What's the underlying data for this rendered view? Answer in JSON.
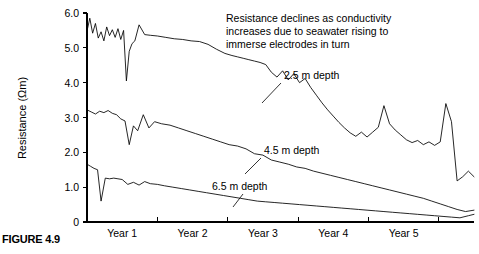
{
  "figure": {
    "caption": "FIGURE 4.9"
  },
  "chart_data": {
    "type": "line",
    "title": "",
    "xlabel": "",
    "ylabel": "Resistance (Ωm)",
    "ylim": [
      0,
      6.0
    ],
    "xlim": [
      0,
      5.5
    ],
    "grid": false,
    "legend_position": "inline-annotations",
    "y_ticks": [
      "0",
      "1.0",
      "2.0",
      "3.0",
      "4.0",
      "5.0",
      "6.0"
    ],
    "y_tick_values": [
      0,
      1.0,
      2.0,
      3.0,
      4.0,
      5.0,
      6.0
    ],
    "x_ticks": [
      "Year 1",
      "Year 2",
      "Year 3",
      "Year 4",
      "Year 5"
    ],
    "x_tick_centers": [
      0.5,
      1.5,
      2.5,
      3.5,
      4.5
    ],
    "x_tick_boundaries": [
      1,
      2,
      3,
      4,
      5
    ],
    "annotation": {
      "line1": "Resistance declines as conductivity",
      "line2": "increases due to seawater rising to",
      "line3": "immerse electrodes in turn"
    },
    "series": [
      {
        "name": "2.5 m depth",
        "label": "2.5 m depth",
        "x": [
          0.0,
          0.04,
          0.08,
          0.12,
          0.16,
          0.2,
          0.24,
          0.28,
          0.32,
          0.36,
          0.4,
          0.44,
          0.48,
          0.52,
          0.56,
          0.6,
          0.64,
          0.68,
          0.74,
          0.82,
          0.9,
          1.0,
          1.12,
          1.24,
          1.36,
          1.48,
          1.6,
          1.72,
          1.84,
          1.96,
          2.06,
          2.14,
          2.22,
          2.3,
          2.38,
          2.46,
          2.54,
          2.62,
          2.7,
          2.78,
          2.86,
          2.94,
          3.02,
          3.1,
          3.18,
          3.26,
          3.34,
          3.42,
          3.5,
          3.58,
          3.66,
          3.74,
          3.82,
          3.9,
          3.98,
          4.06,
          4.14,
          4.22,
          4.3,
          4.38,
          4.46,
          4.54,
          4.62,
          4.7,
          4.78,
          4.86,
          4.94,
          5.02,
          5.1,
          5.18,
          5.26,
          5.34,
          5.42,
          5.5
        ],
        "y": [
          5.48,
          5.85,
          5.42,
          5.7,
          5.28,
          5.46,
          5.2,
          5.6,
          5.35,
          5.52,
          5.3,
          5.55,
          5.24,
          5.5,
          4.05,
          4.9,
          5.12,
          5.2,
          5.66,
          5.38,
          5.36,
          5.34,
          5.3,
          5.26,
          5.24,
          5.2,
          5.18,
          5.1,
          4.96,
          4.84,
          4.78,
          4.74,
          4.7,
          4.66,
          4.62,
          4.58,
          4.52,
          4.3,
          4.16,
          4.34,
          4.08,
          4.26,
          4.0,
          4.12,
          3.86,
          3.64,
          3.42,
          3.22,
          3.04,
          2.86,
          2.7,
          2.56,
          2.46,
          2.58,
          2.44,
          2.58,
          2.72,
          3.34,
          2.82,
          2.64,
          2.5,
          2.36,
          2.28,
          2.34,
          2.22,
          2.3,
          2.2,
          2.3,
          3.4,
          2.88,
          1.18,
          1.3,
          1.46,
          1.3
        ]
      },
      {
        "name": "4.5 m depth",
        "label": "4.5 m depth",
        "x": [
          0.0,
          0.06,
          0.12,
          0.18,
          0.24,
          0.3,
          0.36,
          0.42,
          0.48,
          0.54,
          0.6,
          0.66,
          0.72,
          0.8,
          0.88,
          0.96,
          1.06,
          1.18,
          1.3,
          1.42,
          1.54,
          1.66,
          1.78,
          1.9,
          2.02,
          2.14,
          2.26,
          2.38,
          2.5,
          2.62,
          2.74,
          2.86,
          2.98,
          3.1,
          3.22,
          3.34,
          3.46,
          3.58,
          3.7,
          3.82,
          3.94,
          4.06,
          4.18,
          4.3,
          4.42,
          4.54,
          4.66,
          4.78,
          4.9,
          5.02,
          5.14,
          5.26,
          5.38,
          5.5
        ],
        "y": [
          3.22,
          3.16,
          3.1,
          3.18,
          3.14,
          3.2,
          3.12,
          3.08,
          2.96,
          2.9,
          2.22,
          2.76,
          2.62,
          3.08,
          2.7,
          2.88,
          2.82,
          2.78,
          2.7,
          2.62,
          2.54,
          2.46,
          2.38,
          2.3,
          2.22,
          2.18,
          2.1,
          1.96,
          1.92,
          1.78,
          1.72,
          1.66,
          1.58,
          1.54,
          1.46,
          1.4,
          1.34,
          1.28,
          1.22,
          1.16,
          1.1,
          1.04,
          0.98,
          0.92,
          0.86,
          0.8,
          0.74,
          0.68,
          0.6,
          0.52,
          0.44,
          0.36,
          0.3,
          0.34
        ]
      },
      {
        "name": "6.5 m depth",
        "label": "6.5 m depth",
        "x": [
          0.0,
          0.05,
          0.1,
          0.15,
          0.2,
          0.26,
          0.32,
          0.38,
          0.44,
          0.5,
          0.58,
          0.66,
          0.74,
          0.82,
          0.9,
          1.0,
          1.1,
          1.22,
          1.34,
          1.46,
          1.58,
          1.7,
          1.82,
          1.94,
          2.06,
          2.18,
          2.3,
          2.42,
          2.54,
          2.66,
          2.78,
          2.9,
          3.02,
          3.14,
          3.26,
          3.38,
          3.5,
          3.62,
          3.74,
          3.86,
          3.98,
          4.1,
          4.22,
          4.34,
          4.46,
          4.58,
          4.7,
          4.82,
          4.94,
          5.06,
          5.18,
          5.3,
          5.42,
          5.5
        ],
        "y": [
          1.66,
          1.6,
          1.54,
          1.5,
          0.6,
          1.26,
          1.24,
          1.26,
          1.24,
          1.22,
          1.08,
          1.14,
          1.06,
          1.16,
          1.1,
          1.08,
          1.04,
          1.0,
          0.96,
          0.92,
          0.88,
          0.84,
          0.8,
          0.76,
          0.72,
          0.68,
          0.64,
          0.6,
          0.58,
          0.56,
          0.54,
          0.52,
          0.5,
          0.48,
          0.46,
          0.44,
          0.42,
          0.4,
          0.38,
          0.36,
          0.34,
          0.32,
          0.3,
          0.28,
          0.26,
          0.24,
          0.22,
          0.2,
          0.18,
          0.16,
          0.14,
          0.12,
          0.18,
          0.22
        ]
      }
    ]
  }
}
